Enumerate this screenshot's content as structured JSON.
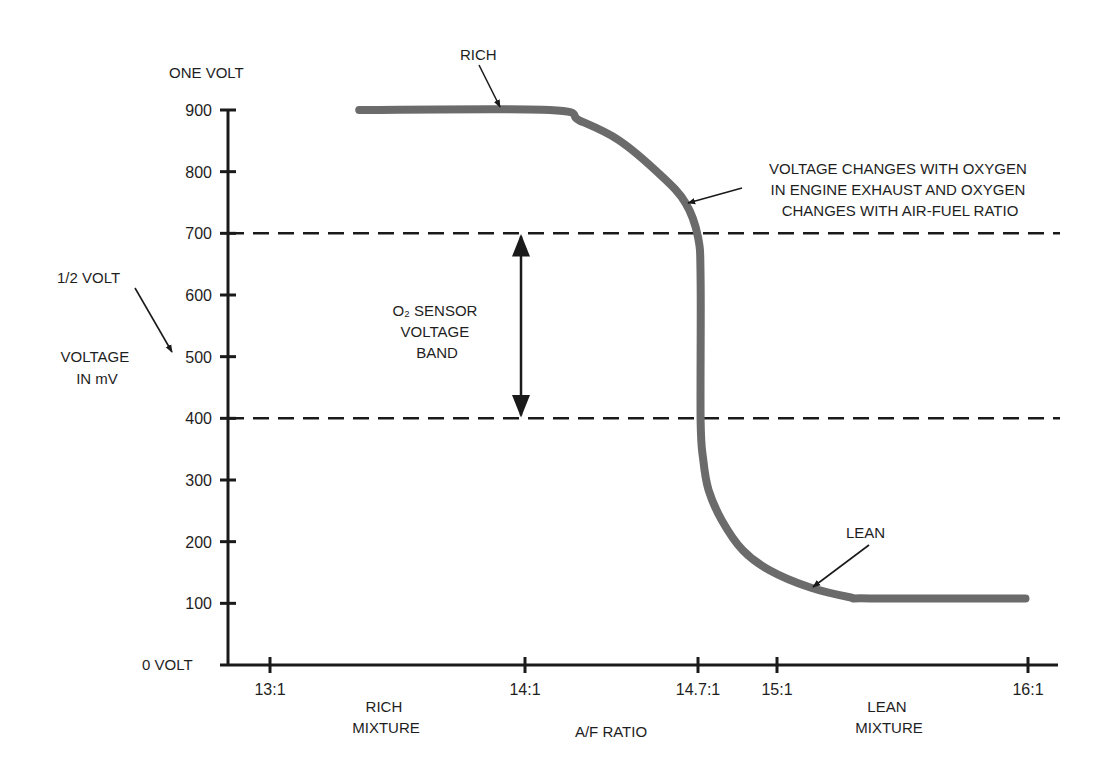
{
  "chart_data": {
    "type": "line",
    "title": "",
    "xlabel": "A/F RATIO",
    "ylabel": "VOLTAGE IN mV",
    "ylabel_lines": [
      "VOLTAGE",
      "IN mV"
    ],
    "ylim": [
      0,
      900
    ],
    "xlim": [
      12.85,
      16.1
    ],
    "grid": false,
    "y_ticks": [
      100,
      200,
      300,
      400,
      500,
      600,
      700,
      800,
      900
    ],
    "y_tick_labels": [
      "100",
      "200",
      "300",
      "400",
      "500",
      "600",
      "700",
      "800",
      "900"
    ],
    "x_ticks": [
      13,
      14,
      14.7,
      15,
      16
    ],
    "x_tick_labels": [
      "13:1",
      "14:1",
      "14.7:1",
      "15:1",
      "16:1"
    ],
    "y_axis_top_label": "ONE VOLT",
    "y_axis_zero_label": "0 VOLT",
    "series": [
      {
        "name": "O2 sensor voltage",
        "color": "#6b6b6b",
        "x": [
          13.35,
          14.1,
          14.22,
          14.38,
          14.55,
          14.65,
          14.7,
          14.71,
          14.71,
          14.72,
          14.74,
          14.79,
          14.87,
          14.97,
          15.13,
          15.29,
          15.37,
          15.99
        ],
        "y": [
          900,
          900,
          883,
          851,
          794,
          749,
          694,
          624,
          397,
          332,
          284,
          235,
          186,
          154,
          126,
          110,
          108,
          108
        ]
      }
    ],
    "reference_lines": [
      {
        "axis": "y",
        "value": 700,
        "style": "dashed"
      },
      {
        "axis": "y",
        "value": 400,
        "style": "dashed"
      }
    ],
    "band": {
      "from": 400,
      "to": 700,
      "x": 14.0,
      "label_lines": [
        "O₂ SENSOR",
        "VOLTAGE",
        "BAND"
      ]
    },
    "annotations": [
      {
        "id": "rich",
        "text_lines": [
          "RICH"
        ],
        "target": [
          14.0,
          900
        ]
      },
      {
        "id": "lean",
        "text_lines": [
          "LEAN"
        ],
        "target": [
          15.15,
          123
        ]
      },
      {
        "id": "half-volt",
        "text_lines": [
          "1/2 VOLT"
        ],
        "target_value_mv": 500
      },
      {
        "id": "voltage-changes",
        "text_lines": [
          "VOLTAGE CHANGES WITH OXYGEN",
          "IN ENGINE EXHAUST AND OXYGEN",
          "CHANGES WITH AIR-FUEL RATIO"
        ],
        "target": [
          14.66,
          755
        ]
      }
    ],
    "x_region_labels": [
      {
        "id": "rich-mixture",
        "text_lines": [
          "RICH",
          "MIXTURE"
        ]
      },
      {
        "id": "lean-mixture",
        "text_lines": [
          "LEAN",
          "MIXTURE"
        ]
      }
    ]
  }
}
